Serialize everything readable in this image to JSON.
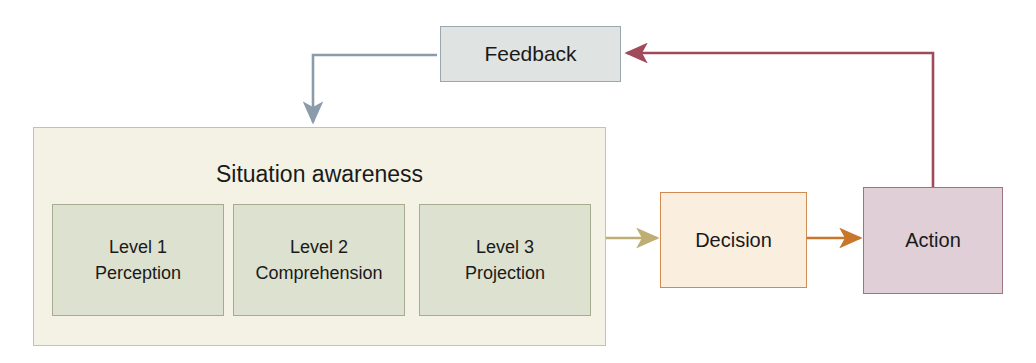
{
  "diagram": {
    "canvas": {
      "width": 1036,
      "height": 363,
      "background": "#ffffff"
    },
    "nodes": {
      "feedback": {
        "label": "Feedback",
        "fill": "#dfe3e2",
        "stroke": "#9aa7ae"
      },
      "situation_awareness": {
        "label": "Situation awareness",
        "fill": "#f4f2e4",
        "stroke": "#c8c39a"
      },
      "level_1": {
        "line1": "Level 1",
        "line2": "Perception",
        "fill": "#dde1d0",
        "stroke": "#a7ac90"
      },
      "level_2": {
        "line1": "Level 2",
        "line2": "Comprehension",
        "fill": "#dde1d0",
        "stroke": "#a7ac90"
      },
      "level_3": {
        "line1": "Level 3",
        "line2": "Projection",
        "fill": "#dde1d0",
        "stroke": "#a7ac90"
      },
      "decision": {
        "label": "Decision",
        "fill": "#faeedf",
        "stroke": "#d18b52"
      },
      "action": {
        "label": "Action",
        "fill": "#e0cfd6",
        "stroke": "#9e7484"
      }
    },
    "connectors": [
      {
        "name": "level3-to-decision",
        "from": "level_3",
        "to": "decision",
        "color": "#bfae74",
        "style": "solid-arrow"
      },
      {
        "name": "decision-to-action",
        "from": "decision",
        "to": "action",
        "color": "#c8762a",
        "style": "solid-arrow"
      },
      {
        "name": "action-to-feedback",
        "from": "action",
        "to": "feedback",
        "color": "#a14a5c",
        "style": "elbow-arrow"
      },
      {
        "name": "feedback-to-situation-awareness",
        "from": "feedback",
        "to": "situation_awareness",
        "color": "#8b9bab",
        "style": "elbow-arrow"
      }
    ]
  }
}
